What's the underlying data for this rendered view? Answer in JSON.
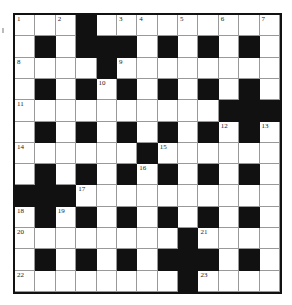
{
  "puzzle": {
    "rows": 13,
    "cols": 13,
    "grid": [
      "...#.........",
      ".#.###.#.#.#.",
      "....#........",
      ".#.#.#.#.#.#.",
      "..........###",
      ".#.#.#.#.#.#.",
      "......#......",
      ".#.#.#.#.#.#.",
      "###..........",
      ".#.#.#.#.#.#.",
      "........#....",
      ".#.#.#.###.#.",
      "........#...."
    ],
    "numbers": [
      {
        "r": 0,
        "c": 0,
        "n": "1"
      },
      {
        "r": 0,
        "c": 2,
        "n": "2"
      },
      {
        "r": 0,
        "c": 5,
        "n": "3"
      },
      {
        "r": 0,
        "c": 6,
        "n": "4"
      },
      {
        "r": 0,
        "c": 8,
        "n": "5"
      },
      {
        "r": 0,
        "c": 10,
        "n": "6"
      },
      {
        "r": 0,
        "c": 12,
        "n": "7"
      },
      {
        "r": 2,
        "c": 0,
        "n": "8"
      },
      {
        "r": 2,
        "c": 5,
        "n": "9"
      },
      {
        "r": 3,
        "c": 4,
        "n": "10"
      },
      {
        "r": 4,
        "c": 0,
        "n": "11"
      },
      {
        "r": 5,
        "c": 10,
        "n": "12"
      },
      {
        "r": 5,
        "c": 12,
        "n": "13"
      },
      {
        "r": 6,
        "c": 0,
        "n": "14"
      },
      {
        "r": 6,
        "c": 7,
        "n": "15"
      },
      {
        "r": 7,
        "c": 6,
        "n": "16"
      },
      {
        "r": 8,
        "c": 3,
        "n": "17"
      },
      {
        "r": 9,
        "c": 0,
        "n": "18"
      },
      {
        "r": 9,
        "c": 2,
        "n": "19"
      },
      {
        "r": 10,
        "c": 0,
        "n": "20"
      },
      {
        "r": 10,
        "c": 9,
        "n": "21"
      },
      {
        "r": 12,
        "c": 0,
        "n": "22"
      },
      {
        "r": 12,
        "c": 9,
        "n": "23"
      }
    ],
    "colors": {
      "black": "#111111",
      "white": "#ffffff",
      "gridline": "#999999"
    }
  }
}
